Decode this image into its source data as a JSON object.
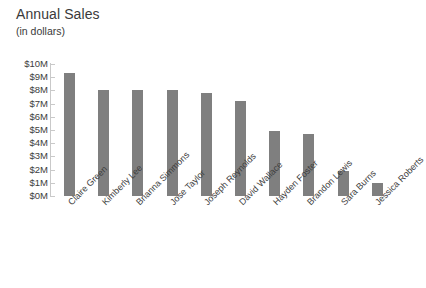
{
  "chart_data": {
    "type": "bar",
    "title": "Annual Sales",
    "subtitle": "(in dollars)",
    "xlabel": "",
    "ylabel": "",
    "ylim": [
      0,
      10
    ],
    "y_unit": "$M",
    "grid": false,
    "legend": "none",
    "bar_color": "#7f7f7f",
    "categories": [
      "Claire Green",
      "Kimberly Lee",
      "Brianna Simmons",
      "Jose Taylor",
      "Joseph Reynolds",
      "David Wallace",
      "Hayden Foster",
      "Brandon Lewis",
      "Sara Burns",
      "Jessica Roberts"
    ],
    "values": [
      9.3,
      8.0,
      8.0,
      8.0,
      7.8,
      7.2,
      4.95,
      4.7,
      1.9,
      1.0
    ],
    "ytick_labels": [
      "$10M",
      "$9M",
      "$8M",
      "$7M",
      "$6M",
      "$5M",
      "$4M",
      "$3M",
      "$2M",
      "$1M",
      "$0M"
    ],
    "ytick_values": [
      10,
      9,
      8,
      7,
      6,
      5,
      4,
      3,
      2,
      1,
      0
    ]
  },
  "footer": {
    "clipped_text": ""
  }
}
